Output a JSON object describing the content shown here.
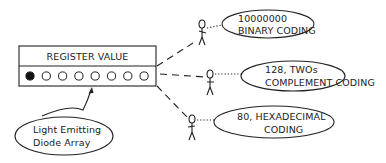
{
  "register": {
    "title": "REGISTER VALUE",
    "leds": [
      true,
      false,
      false,
      false,
      false,
      false,
      false,
      false
    ]
  },
  "led_callout": {
    "line1": "Light Emitting",
    "line2": "Diode Array"
  },
  "interpretations": [
    {
      "line1": "10000000",
      "line2": "BINARY CODING"
    },
    {
      "line1": "128, TWOs",
      "line2": "COMPLEMENT CODING"
    },
    {
      "line1": "80, HEXADECIMAL",
      "line2": "CODING"
    }
  ],
  "colors": {
    "ink": "#222222",
    "background": "#ffffff"
  }
}
